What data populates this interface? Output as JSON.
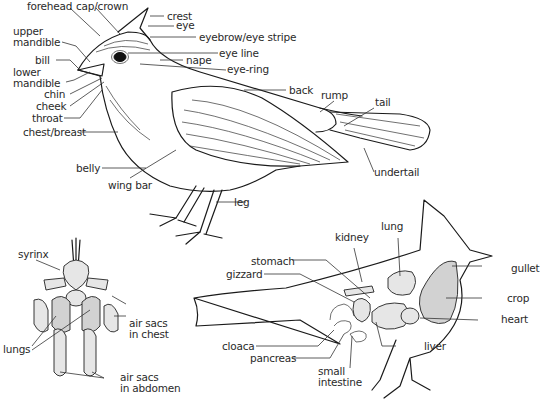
{
  "diagram": {
    "external_anatomy": {
      "labels": [
        {
          "id": "forehead",
          "text": "forehead"
        },
        {
          "id": "cap",
          "text": "cap/crown"
        },
        {
          "id": "crest",
          "text": "crest"
        },
        {
          "id": "eye",
          "text": "eye"
        },
        {
          "id": "eyebrow",
          "text": "eyebrow/eye stripe"
        },
        {
          "id": "upper",
          "text": "upper"
        },
        {
          "id": "mandible1",
          "text": "mandible"
        },
        {
          "id": "bill",
          "text": "bill"
        },
        {
          "id": "lower",
          "text": "lower"
        },
        {
          "id": "mandible2",
          "text": "mandible"
        },
        {
          "id": "nape",
          "text": "nape"
        },
        {
          "id": "eyeline",
          "text": "eye line"
        },
        {
          "id": "eyering",
          "text": "eye-ring"
        },
        {
          "id": "chin",
          "text": "chin"
        },
        {
          "id": "cheek",
          "text": "cheek"
        },
        {
          "id": "throat",
          "text": "throat"
        },
        {
          "id": "chest",
          "text": "chest/breast"
        },
        {
          "id": "back",
          "text": "back"
        },
        {
          "id": "rump",
          "text": "rump"
        },
        {
          "id": "tail",
          "text": "tail"
        },
        {
          "id": "undertail",
          "text": "undertail"
        },
        {
          "id": "belly",
          "text": "belly"
        },
        {
          "id": "wingbar",
          "text": "wing bar"
        },
        {
          "id": "leg",
          "text": "leg"
        }
      ]
    },
    "respiratory_system": {
      "labels": [
        {
          "id": "syrinx",
          "text": "syrinx"
        },
        {
          "id": "airchest1",
          "text": "air sacs"
        },
        {
          "id": "airchest2",
          "text": "in chest"
        },
        {
          "id": "lungs",
          "text": "lungs"
        },
        {
          "id": "airabd1",
          "text": "air sacs"
        },
        {
          "id": "airabd2",
          "text": "in abdomen"
        }
      ]
    },
    "internal_anatomy": {
      "labels": [
        {
          "id": "lung",
          "text": "lung"
        },
        {
          "id": "kidney",
          "text": "kidney"
        },
        {
          "id": "stomach",
          "text": "stomach"
        },
        {
          "id": "gizzard",
          "text": "gizzard"
        },
        {
          "id": "gullet",
          "text": "gullet"
        },
        {
          "id": "crop",
          "text": "crop"
        },
        {
          "id": "heart",
          "text": "heart"
        },
        {
          "id": "cloaca",
          "text": "cloaca"
        },
        {
          "id": "pancreas",
          "text": "pancreas"
        },
        {
          "id": "liver",
          "text": "liver"
        },
        {
          "id": "small1",
          "text": "small"
        },
        {
          "id": "small2",
          "text": "intestine"
        }
      ]
    }
  }
}
